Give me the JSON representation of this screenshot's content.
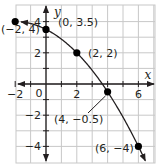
{
  "chart_data": {
    "type": "line",
    "title": "",
    "xlabel": "x",
    "ylabel": "y",
    "xlim": [
      -2,
      6.5
    ],
    "ylim": [
      -5,
      5
    ],
    "grid": true,
    "x_ticks": [
      -2,
      0,
      2,
      6
    ],
    "y_ticks": [
      4,
      2,
      -2,
      -4
    ],
    "x_tick_labels": [
      "−2",
      "0",
      "2",
      "6"
    ],
    "y_tick_labels": [
      "4",
      "2",
      "−2",
      "−4"
    ],
    "origin_label": "0",
    "series": [
      {
        "name": "curve",
        "equation": "y = 3.5 - 0.5x - 0.125x^2",
        "x": [
          -2,
          0,
          2,
          4,
          6
        ],
        "y": [
          4,
          3.5,
          2,
          -0.5,
          -4
        ]
      }
    ],
    "points": [
      {
        "x": -2,
        "y": 4,
        "label": "(−2, 4)"
      },
      {
        "x": 0,
        "y": 3.5,
        "label": "(0, 3.5)"
      },
      {
        "x": 2,
        "y": 2,
        "label": "(2, 2)"
      },
      {
        "x": 4,
        "y": -0.5,
        "label": "(4, −0.5)"
      },
      {
        "x": 6,
        "y": -4,
        "label": "(6, −4)"
      }
    ],
    "colors": {
      "grid": "#c8c8c8",
      "axis": "#231f20",
      "curve": "#231f20",
      "point": "#000000"
    }
  }
}
